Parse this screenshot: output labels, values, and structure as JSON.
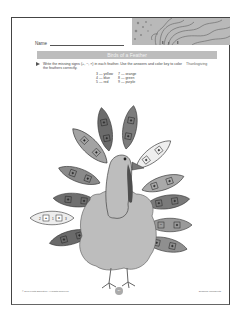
{
  "header": {
    "name_label": "Name",
    "title": "Birds of a Feather",
    "subject_tag": "Thanksgiving"
  },
  "instructions": "Write the missing signs (+, −, ×) in each feather. Use the answers and color key to color the feathers correctly.",
  "color_key": [
    {
      "number": "3",
      "color": "yellow",
      "label": "3 — yellow"
    },
    {
      "number": "7",
      "color": "orange",
      "label": "7 — orange"
    },
    {
      "number": "4",
      "color": "blue",
      "label": "4 — blue"
    },
    {
      "number": "8",
      "color": "green",
      "label": "8 — green"
    },
    {
      "number": "5",
      "color": "red",
      "label": "5 — red"
    },
    {
      "number": "9",
      "color": "purple",
      "label": "9 — purple"
    }
  ],
  "feathers": [
    {
      "id": "left-1",
      "equation": "14 ▢ 5 ▢ 9",
      "shade": "#6a6a6a"
    },
    {
      "id": "left-2",
      "equation": "2 + 1 = 3",
      "a": "2",
      "op": "+",
      "b": "1",
      "result": "3",
      "shade": "#ededed"
    },
    {
      "id": "left-3",
      "equation": "15 ▢ 6 ▢ 9",
      "shade": "#6f6f6f"
    },
    {
      "id": "left-4",
      "equation": "12 ▢ 4 ▢ 8",
      "shade": "#8a8a8a"
    },
    {
      "id": "left-5",
      "equation": "6 ▢ 2 ▢ 7",
      "shade": "#a3a3a3"
    },
    {
      "id": "top-1",
      "equation": "4 ▢ 2 ▢ 12",
      "shade": "#6b6b6b"
    },
    {
      "id": "top-2",
      "equation": "1 ▢ 4 ▢ 10",
      "shade": "#7c7c7c"
    },
    {
      "id": "right-1",
      "equation": "3 ▢ 1 ▢ 3",
      "shade": "#efefef"
    },
    {
      "id": "right-2",
      "equation": "2 ▢ 4 ▢ 8",
      "shade": "#a9a9a9"
    },
    {
      "id": "right-3",
      "equation": "5 ▢ 1 ▢ 6",
      "shade": "#7a7a7a"
    },
    {
      "id": "right-4",
      "equation": "15 ▢ 8 ▢ 7",
      "shade": "#9a9a9a"
    },
    {
      "id": "right-5",
      "equation": "4 ▢ 2 ▢ 8",
      "shade": "#8f8f8f"
    }
  ],
  "footer": {
    "copyright": "© 2007 Fiesta Education. All Rights Reserved.",
    "page_number": "29",
    "series": "Seasonal Worksheets"
  },
  "colors": {
    "title_bar": "#bdbdbd",
    "turkey_body": "#bdbdbd",
    "border": "#444444"
  }
}
